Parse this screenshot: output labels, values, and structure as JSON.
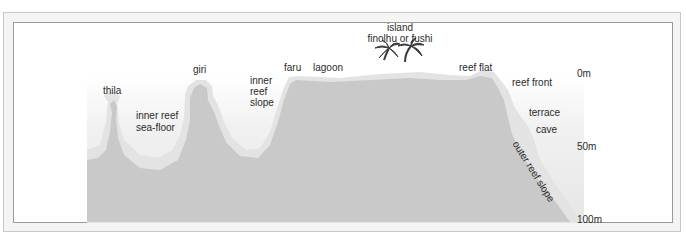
{
  "diagram": {
    "colors": {
      "frame_bg": "#f4f4f4",
      "panel_border": "#9a9a9a",
      "reef_fill": "#c9c9c9",
      "water_light": "#f3f3f3",
      "water_dark": "#e2e2e2",
      "text": "#2b2b2b"
    },
    "labels": {
      "thila": "thila",
      "inner_reef_seafloor_1": "inner reef",
      "inner_reef_seafloor_2": "sea-floor",
      "giri": "giri",
      "inner_reef_slope_1": "inner",
      "inner_reef_slope_2": "reef",
      "inner_reef_slope_3": "slope",
      "faru": "faru",
      "lagoon": "lagoon",
      "island_1": "island",
      "island_2": "finolhu or fushi",
      "reef_flat": "reef flat",
      "reef_front": "reef front",
      "terrace": "terrace",
      "cave": "cave",
      "outer_reef_slope": "outer reef slope"
    },
    "depth_scale": [
      "0m",
      "50m",
      "100m"
    ],
    "icons": [
      "palm-tree-icon",
      "palm-tree-icon"
    ]
  }
}
